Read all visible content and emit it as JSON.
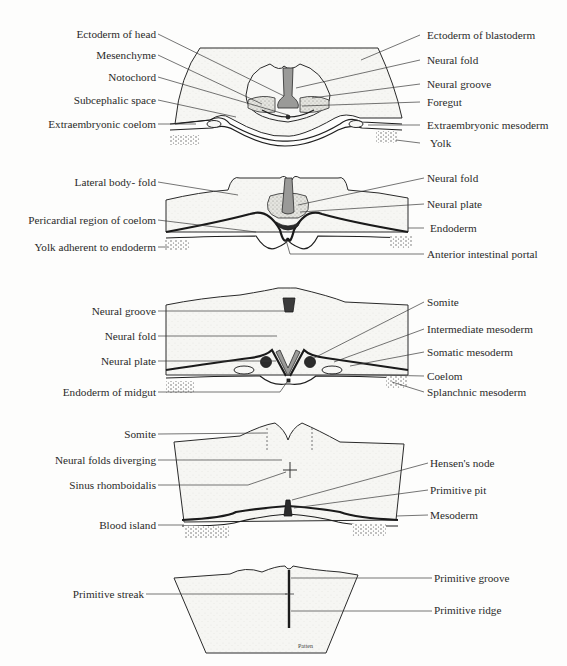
{
  "figure": {
    "signature": "Patten",
    "panels": [
      {
        "id": "head-section",
        "left_labels": [
          {
            "text": "Ectoderm of head",
            "y": 36
          },
          {
            "text": "Mesenchyme",
            "y": 57
          },
          {
            "text": "Notochord",
            "y": 79
          },
          {
            "text": "Subcephalic space",
            "y": 102
          },
          {
            "text": "Extraembryonic coelom",
            "y": 126
          }
        ],
        "right_labels": [
          {
            "text": "Ectoderm of blastoderm",
            "y": 37
          },
          {
            "text": "Neural fold",
            "y": 62
          },
          {
            "text": "Neural groove",
            "y": 86
          },
          {
            "text": "Foregut",
            "y": 104
          },
          {
            "text": "Extraembryonic mesoderm",
            "y": 127
          },
          {
            "text": "Yolk",
            "y": 145
          }
        ]
      },
      {
        "id": "anterior-intestinal-portal-section",
        "left_labels": [
          {
            "text": "Lateral body- fold",
            "y": 184
          },
          {
            "text": "Pericardial region of coelom",
            "y": 222
          },
          {
            "text": "Yolk adherent to endoderm",
            "y": 249
          }
        ],
        "right_labels": [
          {
            "text": "Neural fold",
            "y": 180
          },
          {
            "text": "Neural plate",
            "y": 206
          },
          {
            "text": "Endoderm",
            "y": 230
          },
          {
            "text": "Anterior intestinal portal",
            "y": 256
          }
        ]
      },
      {
        "id": "midgut-section",
        "left_labels": [
          {
            "text": "Neural groove",
            "y": 313
          },
          {
            "text": "Neural fold",
            "y": 338
          },
          {
            "text": "Neural plate",
            "y": 363
          },
          {
            "text": "Endoderm of midgut",
            "y": 394
          }
        ],
        "right_labels": [
          {
            "text": "Somite",
            "y": 304
          },
          {
            "text": "Intermediate mesoderm",
            "y": 331
          },
          {
            "text": "Somatic mesoderm",
            "y": 354
          },
          {
            "text": "Coelom",
            "y": 378
          },
          {
            "text": "Splanchnic mesoderm",
            "y": 394
          }
        ]
      },
      {
        "id": "hensens-node-section",
        "left_labels": [
          {
            "text": "Somite",
            "y": 436
          },
          {
            "text": "Neural folds diverging",
            "y": 462
          },
          {
            "text": "Sinus rhomboidalis",
            "y": 487
          },
          {
            "text": "Blood island",
            "y": 527
          }
        ],
        "right_labels": [
          {
            "text": "Hensen's node",
            "y": 465
          },
          {
            "text": "Primitive pit",
            "y": 492
          },
          {
            "text": "Mesoderm",
            "y": 517
          }
        ]
      },
      {
        "id": "primitive-streak-section",
        "left_labels": [
          {
            "text": "Primitive streak",
            "y": 597
          }
        ],
        "right_labels": [
          {
            "text": "Primitive groove",
            "y": 580
          },
          {
            "text": "Primitive ridge",
            "y": 612
          }
        ]
      }
    ]
  }
}
